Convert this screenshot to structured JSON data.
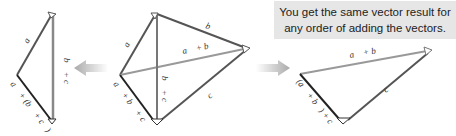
{
  "callout": {
    "line1": "You get the same vector result for",
    "line2": "any order of adding the vectors."
  },
  "left_diagram": {
    "labels": {
      "a": "a⃗",
      "b_plus_c": "b⃗ + c⃗",
      "resultant": "a⃗ + (b⃗ + c⃗)"
    }
  },
  "center_diagram": {
    "labels": {
      "a": "a⃗",
      "b": "b⃗",
      "c": "c⃗",
      "a_plus_b": "a⃗ + b⃗",
      "b_plus_c": "b⃗ + c⃗",
      "resultant": "a⃗ + b⃗ + c⃗"
    }
  },
  "right_diagram": {
    "labels": {
      "a_plus_b": "a⃗ + b⃗",
      "c": "c⃗",
      "resultant": "(a⃗ + b⃗) + c⃗"
    }
  },
  "arrows": {
    "left_arrow": "arrow-left",
    "right_arrow": "arrow-right"
  },
  "colors": {
    "vector_dark": "#555555",
    "vector_light": "#999999",
    "resultant": "#222222",
    "arrow_fill": "#bbbbbb",
    "callout_bg": "#e6e6e6"
  }
}
